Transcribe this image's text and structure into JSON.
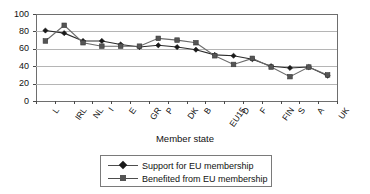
{
  "chart_data": {
    "type": "line",
    "title": "",
    "xlabel": "Member state",
    "ylabel": "",
    "ylim": [
      0,
      100
    ],
    "yticks": [
      0,
      20,
      40,
      60,
      80,
      100
    ],
    "grid": true,
    "legend_position": "bottom",
    "categories": [
      "L",
      "IRL",
      "NL",
      "I",
      "E",
      "GR",
      "P",
      "DK",
      "B",
      "EU15",
      "D",
      "F",
      "FIN",
      "S",
      "A",
      "UK"
    ],
    "series": [
      {
        "name": "Support for EU membership",
        "marker": "diamond",
        "color": "#1a1a1a",
        "values": [
          81,
          78,
          69,
          69,
          65,
          62,
          64,
          62,
          59,
          53,
          52,
          48,
          40,
          38,
          39,
          29
        ]
      },
      {
        "name": "Benefited from EU membership",
        "marker": "square",
        "color": "#555555",
        "values": [
          69,
          87,
          67,
          63,
          63,
          63,
          72,
          70,
          67,
          52,
          42,
          49,
          39,
          28,
          39,
          30
        ]
      }
    ]
  },
  "axis": {
    "x_title": "Member state"
  }
}
